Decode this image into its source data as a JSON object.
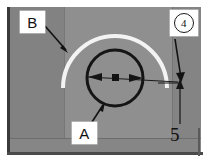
{
  "figure": {
    "kind": "annotated-photograph",
    "background_color": "#8d8d8d",
    "plate_border_color": "#3a3a3a"
  },
  "callouts": [
    {
      "id": "B",
      "label": "B",
      "name": "callout-label-b",
      "points_to": "white-arc",
      "box_color": "#ffffff",
      "text_color": "#111111"
    },
    {
      "id": "A",
      "label": "A",
      "name": "callout-label-a",
      "points_to": "black-circle",
      "box_color": "#ffffff",
      "text_color": "#111111"
    },
    {
      "id": "4",
      "label": "4",
      "name": "callout-label-4",
      "style": "circled-number",
      "points_to": "dimension-leader",
      "box_color": "#ffffff",
      "text_color": "#111111"
    }
  ],
  "dimensions": [
    {
      "id": "5",
      "value": "5",
      "name": "dimension-value-5",
      "orientation": "horizontal",
      "text_color": "#121212"
    }
  ],
  "shapes": {
    "white_arc": {
      "name": "white-arc",
      "color": "#f2f2f2",
      "description": "dome shaped highlight arc"
    },
    "black_circle": {
      "name": "black-circle",
      "color": "#141414",
      "description": "circular outline feature"
    },
    "center_marker": {
      "name": "center-marker-square",
      "color": "#121212"
    },
    "dimension_arrows": {
      "name": "dimension-arrow-pair",
      "color": "#141414"
    }
  }
}
